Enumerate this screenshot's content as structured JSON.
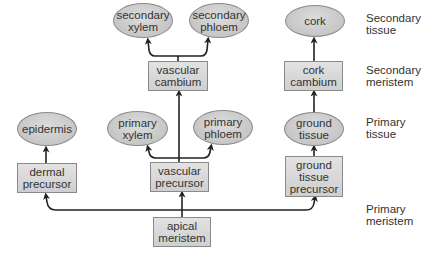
{
  "diagram": {
    "nodes": {
      "secondary_xylem": "secondary\nxylem",
      "secondary_phloem": "secondary\nphloem",
      "cork": "cork",
      "vascular_cambium": "vascular\ncambium",
      "cork_cambium": "cork\ncambium",
      "epidermis": "epidermis",
      "primary_xylem": "primary\nxylem",
      "primary_phloem": "primary\nphloem",
      "ground_tissue": "ground\ntissue",
      "dermal_precursor": "dermal\nprecursor",
      "vascular_precursor": "vascular\nprecursor",
      "ground_tissue_precursor": "ground\ntissue\nprecursor",
      "apical_meristem": "apical\nmeristem"
    },
    "row_labels": {
      "secondary_tissue": "Secondary\ntissue",
      "secondary_meristem": "Secondary\nmeristem",
      "primary_tissue": "Primary\ntissue",
      "primary_meristem": "Primary\nmeristem"
    },
    "edges": [
      [
        "apical_meristem",
        "dermal_precursor"
      ],
      [
        "apical_meristem",
        "vascular_precursor"
      ],
      [
        "apical_meristem",
        "ground_tissue_precursor"
      ],
      [
        "dermal_precursor",
        "epidermis"
      ],
      [
        "vascular_precursor",
        "primary_xylem"
      ],
      [
        "vascular_precursor",
        "primary_phloem"
      ],
      [
        "vascular_precursor",
        "vascular_cambium"
      ],
      [
        "ground_tissue_precursor",
        "ground_tissue"
      ],
      [
        "ground_tissue",
        "cork_cambium"
      ],
      [
        "vascular_cambium",
        "secondary_xylem"
      ],
      [
        "vascular_cambium",
        "secondary_phloem"
      ],
      [
        "cork_cambium",
        "cork"
      ]
    ],
    "colors": {
      "node_fill": "#cfcfcf",
      "node_border": "#8a8a8a",
      "arrow": "#222222",
      "text": "#333333"
    }
  }
}
